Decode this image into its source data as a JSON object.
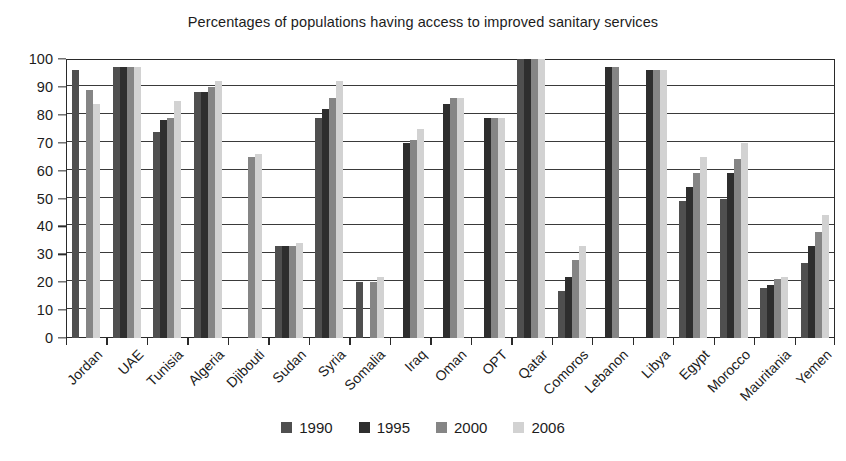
{
  "chart_data": {
    "type": "bar",
    "title": "Percentages of populations having access to improved sanitary services",
    "xlabel": "",
    "ylabel": "",
    "ylim": [
      0,
      100
    ],
    "ytick_step": 10,
    "yticks": [
      0,
      10,
      20,
      30,
      40,
      50,
      60,
      70,
      80,
      90,
      100
    ],
    "grid": "horizontal",
    "legend_position": "bottom-center",
    "categories": [
      "Jordan",
      "UAE",
      "Tunisia",
      "Algeria",
      "Djibouti",
      "Sudan",
      "Syria",
      "Somalia",
      "Iraq",
      "Oman",
      "OPT",
      "Qatar",
      "Comoros",
      "Lebanon",
      "Libya",
      "Egypt",
      "Morocco",
      "Mauritania",
      "Yemen"
    ],
    "series": [
      {
        "name": "1990",
        "color": "#4f4f4f",
        "values": [
          96,
          97,
          74,
          88,
          null,
          33,
          79,
          20,
          null,
          null,
          null,
          100,
          17,
          null,
          null,
          49,
          50,
          18,
          27
        ]
      },
      {
        "name": "1995",
        "color": "#2e2e2e",
        "values": [
          null,
          97,
          78,
          88,
          null,
          33,
          82,
          null,
          70,
          84,
          79,
          100,
          22,
          97,
          96,
          54,
          59,
          19,
          33
        ]
      },
      {
        "name": "2000",
        "color": "#858585",
        "values": [
          89,
          97,
          79,
          90,
          65,
          33,
          86,
          20,
          71,
          86,
          79,
          100,
          28,
          97,
          96,
          59,
          64,
          21,
          38
        ]
      },
      {
        "name": "2006",
        "color": "#d2d2d2",
        "values": [
          84,
          97,
          85,
          92,
          66,
          34,
          92,
          22,
          75,
          86,
          79,
          100,
          33,
          null,
          96,
          65,
          70,
          22,
          44
        ]
      }
    ]
  },
  "legend": {
    "items": [
      {
        "label": "1990",
        "color": "#4f4f4f"
      },
      {
        "label": "1995",
        "color": "#2e2e2e"
      },
      {
        "label": "2000",
        "color": "#858585"
      },
      {
        "label": "2006",
        "color": "#d2d2d2"
      }
    ]
  }
}
